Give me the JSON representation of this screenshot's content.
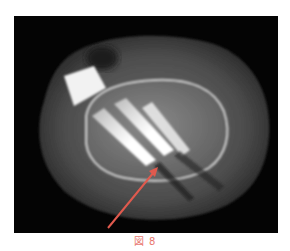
{
  "figure": {
    "caption": "図 8",
    "caption_color": "#e8766e",
    "image": {
      "type": "CT axial scan (grayscale)",
      "background_color": "#040404",
      "annotation": {
        "type": "arrow",
        "color": "#e05a4e",
        "points_to": "tip of implanted screws / artifact region"
      }
    }
  }
}
